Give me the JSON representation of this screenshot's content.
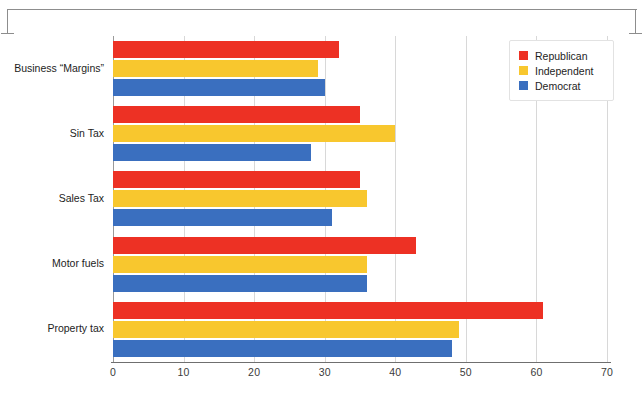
{
  "chart_data": {
    "type": "bar",
    "orientation": "horizontal",
    "title": "",
    "xlabel": "",
    "ylabel": "",
    "xlim": [
      0,
      70
    ],
    "xticks": [
      "0",
      "10",
      "20",
      "30",
      "40",
      "50",
      "60",
      "70"
    ],
    "grid": true,
    "legend_position": "top-right",
    "categories": [
      "Business “Margins”",
      "Sin Tax",
      "Sales Tax",
      "Motor fuels",
      "Property tax"
    ],
    "series": [
      {
        "name": "Republican",
        "color": "#ED3124",
        "values": [
          32,
          35,
          35,
          43,
          61
        ]
      },
      {
        "name": "Independent",
        "color": "#F8C72E",
        "values": [
          29,
          40,
          36,
          36,
          49
        ]
      },
      {
        "name": "Democrat",
        "color": "#3A6FBF",
        "values": [
          30,
          28,
          31,
          36,
          48
        ]
      }
    ]
  },
  "legend": {
    "items": [
      {
        "label": "Republican",
        "swatch": "rep"
      },
      {
        "label": "Independent",
        "swatch": "ind"
      },
      {
        "label": "Democrat",
        "swatch": "dem"
      }
    ]
  },
  "colors": {
    "republican": "#ED3124",
    "independent": "#F8C72E",
    "democrat": "#3A6FBF",
    "axis": "#6F6F6F",
    "grid": "#D8D8D8"
  }
}
